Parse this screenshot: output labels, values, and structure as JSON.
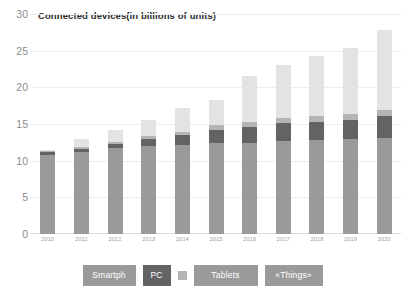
{
  "chart_data": {
    "type": "bar",
    "subtype": "stacked-column",
    "title": "Connected devices(in billions of units)",
    "xlabel": "",
    "ylabel": "",
    "ylim": [
      0,
      30
    ],
    "yticks": [
      0,
      5,
      10,
      15,
      20,
      25,
      30
    ],
    "grid": true,
    "legend_position": "bottom",
    "categories": [
      "2010",
      "2011",
      "2012",
      "2013",
      "2014",
      "2015",
      "2016",
      "2017",
      "2018",
      "2019",
      "2020"
    ],
    "series": [
      {
        "name": "Smartph",
        "color": "#9a9a9a",
        "values": [
          10.8,
          11.2,
          11.8,
          12.0,
          12.2,
          12.4,
          12.5,
          12.7,
          12.9,
          13.0,
          13.1
        ]
      },
      {
        "name": "PC",
        "color": "#636363",
        "values": [
          0.4,
          0.4,
          0.5,
          1.0,
          1.3,
          1.9,
          2.2,
          2.5,
          2.5,
          2.6,
          3.0
        ]
      },
      {
        "name": "Tablets",
        "color": "#b4b4b4",
        "values": [
          0.2,
          0.3,
          0.3,
          0.4,
          0.5,
          0.6,
          0.7,
          0.7,
          0.8,
          0.8,
          0.9
        ]
      },
      {
        "name": "«Things»",
        "color": "#e3e3e3",
        "values": [
          0.1,
          1.1,
          1.7,
          2.2,
          3.3,
          3.5,
          6.3,
          7.2,
          8.2,
          9.1,
          11.0
        ]
      }
    ],
    "totals": [
      11.5,
      13.0,
      14.3,
      15.6,
      17.3,
      18.4,
      21.7,
      23.1,
      24.4,
      25.5,
      28.0
    ]
  },
  "axis": {
    "y_tick_labels": [
      "30",
      "25",
      "20",
      "15",
      "10",
      "5",
      "0"
    ],
    "x_tick_labels": [
      "2010",
      "2011",
      "2012",
      "2013",
      "2014",
      "2015",
      "2016",
      "2017",
      "2018",
      "2019",
      "2020"
    ]
  },
  "legend": {
    "items": [
      {
        "label": "Smartph",
        "color": "#9a9a9a"
      },
      {
        "label": "PC",
        "color": "#636363"
      },
      {
        "label": "",
        "color": "#b4b4b4"
      },
      {
        "label": "Tablets",
        "color": "#9a9a9a"
      },
      {
        "label": "«Things»",
        "color": "#9a9a9a"
      }
    ]
  },
  "colors": {
    "background": "#ffffff",
    "gridline": "#e9eef3",
    "axis_text": "#8c8c8c",
    "title_text": "#2b2b2b",
    "legend_text": "#ffffff"
  }
}
